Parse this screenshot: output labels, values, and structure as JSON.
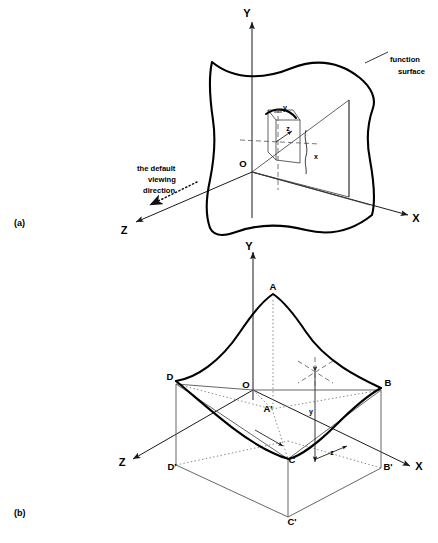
{
  "figure": {
    "panels": [
      {
        "id": "a",
        "label": "(a)",
        "axes": {
          "x": "X",
          "y": "Y",
          "z": "Z",
          "origin": "O"
        },
        "annotations": {
          "function_surface_line1": "function",
          "function_surface_line2": "surface",
          "viewing_line1": "the default",
          "viewing_line2": "viewing",
          "viewing_line3": "direction"
        },
        "point_coords": {
          "x": "x",
          "y": "y",
          "z": "z"
        }
      },
      {
        "id": "b",
        "label": "(b)",
        "axes": {
          "x": "X",
          "y": "Y",
          "z": "Z",
          "origin": "O"
        },
        "vertices": {
          "A": "A",
          "B": "B",
          "C": "C",
          "D": "D",
          "A_prime": "A'",
          "B_prime": "B'",
          "C_prime": "C'",
          "D_prime": "D'"
        },
        "point_coords": {
          "y": "y",
          "z": "z"
        }
      }
    ]
  },
  "style": {
    "ink": "#000000",
    "thin_ink": "#555555",
    "background": "#ffffff"
  }
}
